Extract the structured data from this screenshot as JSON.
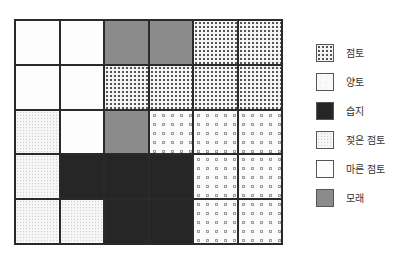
{
  "diagram": {
    "type": "soil-grid-map",
    "rows": 5,
    "cols": 6,
    "grid": [
      [
        "dry",
        "dry",
        "sand",
        "sand",
        "clay",
        "clay"
      ],
      [
        "dry",
        "dry",
        "clay",
        "clay",
        "clay",
        "clay"
      ],
      [
        "wet",
        "dry",
        "sand",
        "loam",
        "loam",
        "loam"
      ],
      [
        "wet",
        "marsh",
        "marsh",
        "marsh",
        "loam",
        "loam"
      ],
      [
        "wet",
        "wet",
        "marsh",
        "marsh",
        "loam",
        "loam"
      ]
    ]
  },
  "legend": {
    "items": [
      {
        "key": "clay",
        "label": "점토"
      },
      {
        "key": "loam",
        "label": "양토"
      },
      {
        "key": "marsh",
        "label": "습지"
      },
      {
        "key": "wet",
        "label": "젖은 점토"
      },
      {
        "key": "dry",
        "label": "마른 점토"
      },
      {
        "key": "sand",
        "label": "모래"
      }
    ]
  },
  "colors": {
    "grid_line": "#2a2a2a",
    "marsh": "#262626",
    "sand": "#8b8b8b"
  }
}
